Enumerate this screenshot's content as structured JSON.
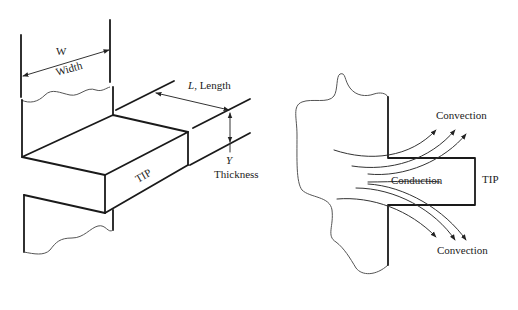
{
  "figure": {
    "left_panel": {
      "title": "Fin geometry (isometric)",
      "labels": {
        "width_symbol": "W",
        "width_text": "Width",
        "length_label": "L, Length",
        "length_symbol": "L",
        "length_text": ", Length",
        "thickness_symbol": "Y",
        "thickness_text": "Thickness",
        "tip": "TIP"
      }
    },
    "right_panel": {
      "title": "Heat flow in fin (side view)",
      "labels": {
        "convection_top": "Convection",
        "conduction": "Conduction",
        "tip": "TIP",
        "convection_bottom": "Convection"
      }
    },
    "colors": {
      "line": "#1a1a1a",
      "text": "#222222",
      "background": "#ffffff"
    }
  }
}
